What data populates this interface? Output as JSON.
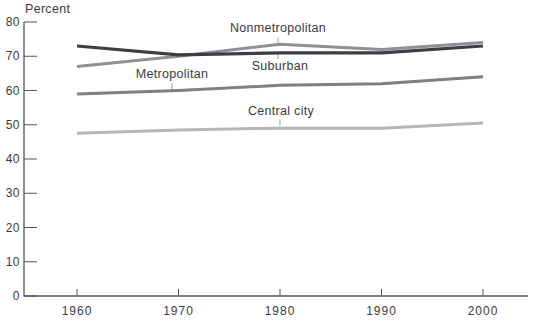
{
  "chart_data": {
    "type": "line",
    "title": "",
    "ylabel": "Percent",
    "xlabel": "",
    "x": [
      1960,
      1970,
      1980,
      1990,
      2000
    ],
    "x_tick_labels": [
      "1960",
      "1970",
      "1980",
      "1990",
      "2000"
    ],
    "yticks": [
      0,
      10,
      20,
      30,
      40,
      50,
      60,
      70,
      80
    ],
    "ylim": [
      0,
      80
    ],
    "grid": false,
    "legend": "inline-labels",
    "series": [
      {
        "name": "Nonmetropolitan",
        "color": "#8f8f94",
        "values": [
          67,
          70,
          73.5,
          72,
          74
        ]
      },
      {
        "name": "Suburban",
        "color": "#3d3d44",
        "values": [
          73,
          70.4,
          71,
          71,
          73
        ]
      },
      {
        "name": "Metropolitan",
        "color": "#7f7f85",
        "values": [
          59,
          60,
          61.5,
          62,
          64
        ]
      },
      {
        "name": "Central city",
        "color": "#b6b6ba",
        "values": [
          47.5,
          48.5,
          49,
          49,
          50.5
        ]
      }
    ],
    "axis_color": "#55555a",
    "tick_label_color": "#3b3b3f",
    "leader_color": "#9b9b9f"
  }
}
